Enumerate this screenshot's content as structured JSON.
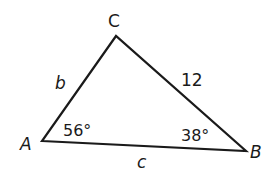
{
  "diagram": {
    "type": "triangle",
    "stroke_color": "#1a1a1a",
    "vertices": {
      "A": {
        "label": "A",
        "x": 42,
        "y": 141
      },
      "B": {
        "label": "B",
        "x": 246,
        "y": 151
      },
      "C": {
        "label": "C",
        "x": 116,
        "y": 36
      }
    },
    "sides": {
      "b": {
        "label": "b",
        "between": "A-C"
      },
      "a": {
        "label": "12",
        "between": "C-B"
      },
      "c": {
        "label": "c",
        "between": "A-B"
      }
    },
    "angles": {
      "A": {
        "label": "56°"
      },
      "B": {
        "label": "38°"
      }
    }
  }
}
